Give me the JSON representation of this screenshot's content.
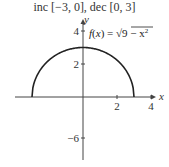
{
  "chart_data": {
    "type": "line",
    "title": "inc [−3, 0], dec [0, 3]",
    "xlabel": "x",
    "ylabel": "y",
    "function_label": "f(x) = √(9 − x²)",
    "function_label_parts": {
      "lhs": "f(x) = ",
      "radical": "√",
      "radicand": "9 − x",
      "exponent": "2"
    },
    "xlim": [
      -3.2,
      4.3
    ],
    "ylim_positive": [
      0,
      4
    ],
    "x_ticks": [
      2,
      4
    ],
    "x_tick_labels": [
      "2",
      "4"
    ],
    "y_ticks": [
      4,
      2,
      -6
    ],
    "y_tick_labels": [
      "4",
      "2",
      "−6"
    ],
    "grid": false,
    "series": [
      {
        "name": "f(x) = √(9 − x²)",
        "domain": [
          -3,
          3
        ],
        "x": [
          -3,
          -2.5,
          -2,
          -1.5,
          -1,
          -0.5,
          0,
          0.5,
          1,
          1.5,
          2,
          2.5,
          3
        ],
        "y": [
          0,
          1.658,
          2.236,
          2.598,
          2.828,
          2.958,
          3,
          2.958,
          2.828,
          2.598,
          2.236,
          1.658,
          0
        ],
        "color": "#222222"
      }
    ]
  }
}
